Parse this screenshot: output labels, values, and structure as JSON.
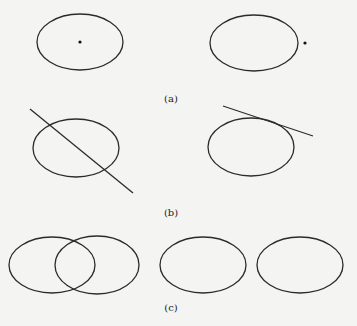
{
  "figure": {
    "background": "#f4f4f2",
    "stroke_color": "#2b2b2b",
    "panels": [
      {
        "id": "a",
        "label": "(a)",
        "label_pos": [
          171,
          102
        ],
        "items": [
          {
            "type": "ellipse",
            "name": "ellipse-a-left",
            "cx": 80,
            "cy": 42,
            "rx": 43,
            "ry": 28
          },
          {
            "type": "point",
            "name": "point-inside",
            "cx": 80,
            "cy": 42,
            "r": 1.6
          },
          {
            "type": "ellipse",
            "name": "ellipse-a-right",
            "cx": 254,
            "cy": 43,
            "rx": 44,
            "ry": 28
          },
          {
            "type": "point",
            "name": "point-outside",
            "cx": 305,
            "cy": 43,
            "r": 1.6
          }
        ]
      },
      {
        "id": "b",
        "label": "(b)",
        "label_pos": [
          171,
          216
        ],
        "items": [
          {
            "type": "ellipse",
            "name": "ellipse-b-left",
            "cx": 76,
            "cy": 148,
            "rx": 43,
            "ry": 29
          },
          {
            "type": "line",
            "name": "secant-line",
            "x1": 30,
            "y1": 109,
            "x2": 133,
            "y2": 193
          },
          {
            "type": "ellipse",
            "name": "ellipse-b-right",
            "cx": 251,
            "cy": 147,
            "rx": 43,
            "ry": 29
          },
          {
            "type": "line",
            "name": "tangent-line",
            "x1": 223,
            "y1": 106,
            "x2": 313,
            "y2": 136
          }
        ]
      },
      {
        "id": "c",
        "label": "(c)",
        "label_pos": [
          171,
          311
        ],
        "items": [
          {
            "type": "ellipse",
            "name": "ellipse-c-overlap-1",
            "cx": 52,
            "cy": 265,
            "rx": 43,
            "ry": 28
          },
          {
            "type": "ellipse",
            "name": "ellipse-c-overlap-2",
            "cx": 97,
            "cy": 265,
            "rx": 42,
            "ry": 29
          },
          {
            "type": "ellipse",
            "name": "ellipse-c-separate-1",
            "cx": 203,
            "cy": 265,
            "rx": 43,
            "ry": 28
          },
          {
            "type": "ellipse",
            "name": "ellipse-c-separate-2",
            "cx": 300,
            "cy": 265,
            "rx": 43,
            "ry": 28
          }
        ]
      }
    ]
  }
}
